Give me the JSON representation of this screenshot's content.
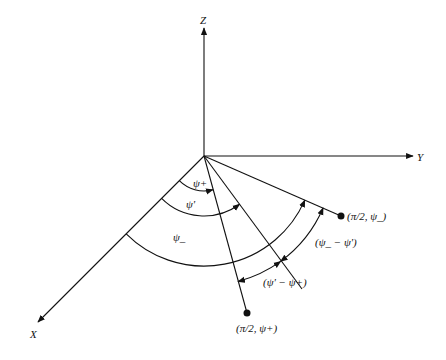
{
  "diagram": {
    "axes": {
      "z_label": "Z",
      "y_label": "Y",
      "x_label": "X"
    },
    "points": {
      "psi_minus_point": "(π/2, ψ_)",
      "psi_plus_point": "(π/2, ψ+)"
    },
    "angles": {
      "psi_plus": "ψ+",
      "psi_prime": "ψ'",
      "psi_minus": "ψ_",
      "diff_minus_prime": "(ψ_ − ψ')",
      "diff_prime_plus": "(ψ' − ψ+)"
    },
    "colors": {
      "stroke": "#111111",
      "background": "#ffffff"
    }
  }
}
